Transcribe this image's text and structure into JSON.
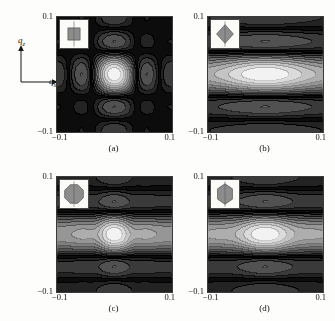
{
  "figure": {
    "kind": "scientific-figure",
    "axes_key": {
      "vertical_label": "qz",
      "vertical_label_base": "q",
      "vertical_label_sub": "z",
      "horizontal_label": "qx",
      "horizontal_label_base": "q",
      "horizontal_label_sub": "x"
    },
    "colors": {
      "background": "#fdfdfb",
      "frame": "#3a3a3a",
      "text": "#111111",
      "inset_background": "#fbfbf8",
      "inset_shape_fill": "#8c8c8c",
      "inset_shape_stroke": "#4d4d4d",
      "contour_low": "#0c0c0c",
      "contour_high": "#f2f2f2"
    },
    "panels": [
      {
        "id": "a",
        "caption": "(a)",
        "xtick_left": "−0.1",
        "xtick_right": "0.1",
        "ytick_top": "0.1",
        "ytick_bottom": "−0.1",
        "inset_shape": "square",
        "inset_name": "inset-shape-square",
        "pattern": "grid",
        "lobes_x": 5,
        "lobes_z": 5
      },
      {
        "id": "b",
        "caption": "(b)",
        "xtick_left": "−0.1",
        "xtick_right": "0.1",
        "ytick_top": "0.1",
        "ytick_bottom": "−0.1",
        "inset_shape": "diamond",
        "inset_name": "inset-shape-diamond",
        "pattern": "bands",
        "lobes_x": 1,
        "lobes_z": 5
      },
      {
        "id": "c",
        "caption": "(c)",
        "xtick_left": "−0.1",
        "xtick_right": "0.1",
        "ytick_top": "0.1",
        "ytick_bottom": "−0.1",
        "inset_shape": "octagon",
        "inset_name": "inset-shape-octagon",
        "pattern": "bands-rippled",
        "lobes_x": 5,
        "lobes_z": 5
      },
      {
        "id": "d",
        "caption": "(d)",
        "xtick_left": "−0.1",
        "xtick_right": "0.1",
        "ytick_top": "0.1",
        "ytick_bottom": "−0.1",
        "inset_shape": "hexagon",
        "inset_name": "inset-shape-hexagon",
        "pattern": "bands-rippled",
        "lobes_x": 3,
        "lobes_z": 5
      }
    ]
  },
  "chart_data": {
    "type": "heatmap",
    "title": "",
    "xlabel": "qx",
    "ylabel": "qz",
    "xlim": [
      -0.1,
      0.1
    ],
    "ylim": [
      -0.1,
      0.1
    ],
    "xticks": [
      -0.1,
      0.1
    ],
    "yticks": [
      -0.1,
      0.1
    ],
    "xticklabels": [
      "−0.1",
      "0.1"
    ],
    "yticklabels": [
      "−0.1",
      "0.1"
    ],
    "grid": false,
    "legend": "none",
    "colormap": "grayscale",
    "colormap_low": "#0c0c0c",
    "colormap_high": "#f2f2f2",
    "panels": [
      {
        "label": "(a)",
        "inset_shape": "square",
        "form_factor": "sinc(qx*Lx/2) * sinc(qz*Lz/2)",
        "separable": true,
        "peak_grid_x": [
          -0.08,
          -0.04,
          0.0,
          0.04,
          0.08
        ],
        "peak_grid_z": [
          -0.08,
          -0.04,
          0.0,
          0.04,
          0.08
        ],
        "central_peak_value": 1.0,
        "first_order_peak_value": 0.45,
        "second_order_peak_value": 0.17,
        "zero_lines_x": [
          -0.1,
          -0.06,
          -0.02,
          0.02,
          0.06,
          0.1
        ],
        "zero_lines_z": [
          -0.1,
          -0.06,
          -0.02,
          0.02,
          0.06,
          0.1
        ],
        "annotation": "separable sinc-squared grid of 5x5 lobes"
      },
      {
        "label": "(b)",
        "inset_shape": "diamond",
        "form_factor": "diamond (rotated square) form factor",
        "separable": false,
        "band_centers_z": [
          -0.08,
          -0.04,
          0.0,
          0.04,
          0.08
        ],
        "band_zero_z": [
          -0.1,
          -0.06,
          -0.02,
          0.02,
          0.06,
          0.1
        ],
        "central_peak_value": 1.0,
        "first_band_peak_value": 0.4,
        "second_band_peak_value": 0.15,
        "x_modulation": "weak, broad horizontal ellipses",
        "annotation": "5 horizontal bands, elongated along qx"
      },
      {
        "label": "(c)",
        "inset_shape": "octagon",
        "form_factor": "octagonal (near-circular) form factor",
        "separable": false,
        "band_centers_z": [
          -0.08,
          -0.04,
          0.0,
          0.04,
          0.08
        ],
        "band_zero_z": [
          -0.1,
          -0.06,
          -0.02,
          0.02,
          0.06,
          0.1
        ],
        "central_peak_value": 1.0,
        "first_band_peak_value": 0.42,
        "second_band_peak_value": 0.18,
        "x_modulation": "strong, 5 ripple lobes along qx",
        "ripple_lobes_x": [
          -0.08,
          -0.04,
          0.0,
          0.04,
          0.08
        ],
        "annotation": "horizontal bands with pronounced qx ripples"
      },
      {
        "label": "(d)",
        "inset_shape": "hexagon",
        "form_factor": "hexagonal form factor",
        "separable": false,
        "band_centers_z": [
          -0.08,
          -0.04,
          0.0,
          0.04,
          0.08
        ],
        "band_zero_z": [
          -0.1,
          -0.06,
          -0.02,
          0.02,
          0.06,
          0.1
        ],
        "central_peak_value": 1.0,
        "first_band_peak_value": 0.38,
        "second_band_peak_value": 0.16,
        "x_modulation": "moderate, 3 ripple lobes along qx",
        "ripple_lobes_x": [
          -0.06,
          0.0,
          0.06
        ],
        "annotation": "horizontal bands with moderate qx ripples"
      }
    ]
  }
}
